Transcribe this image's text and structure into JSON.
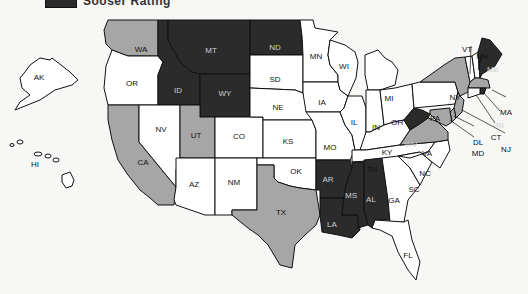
{
  "legend": {
    "label": "Sooser Rating",
    "swatch_color": "#2b2b2b"
  },
  "colors": {
    "dark": "#2b2b2b",
    "gray": "#a6a6a6",
    "white": "#ffffff",
    "background": "#f7f7f5"
  },
  "states": {
    "AK": {
      "label": "AK",
      "fill": "white"
    },
    "HI": {
      "label": "HI",
      "fill": "white"
    },
    "WA": {
      "label": "WA",
      "fill": "gray"
    },
    "OR": {
      "label": "OR",
      "fill": "white"
    },
    "CA": {
      "label": "CA",
      "fill": "gray"
    },
    "ID": {
      "label": "ID",
      "fill": "dark"
    },
    "NV": {
      "label": "NV",
      "fill": "white"
    },
    "MT": {
      "label": "MT",
      "fill": "dark"
    },
    "WY": {
      "label": "WY",
      "fill": "dark"
    },
    "UT": {
      "label": "UT",
      "fill": "gray"
    },
    "AZ": {
      "label": "AZ",
      "fill": "white"
    },
    "CO": {
      "label": "CO",
      "fill": "white"
    },
    "NM": {
      "label": "NM",
      "fill": "white"
    },
    "ND": {
      "label": "ND",
      "fill": "dark"
    },
    "SD": {
      "label": "SD",
      "fill": "white"
    },
    "NE": {
      "label": "NE",
      "fill": "white"
    },
    "KS": {
      "label": "KS",
      "fill": "white"
    },
    "OK": {
      "label": "OK",
      "fill": "white"
    },
    "TX": {
      "label": "TX",
      "fill": "gray"
    },
    "MN": {
      "label": "MN",
      "fill": "white"
    },
    "IA": {
      "label": "IA",
      "fill": "white"
    },
    "MO": {
      "label": "MO",
      "fill": "white"
    },
    "AR": {
      "label": "AR",
      "fill": "dark"
    },
    "LA": {
      "label": "LA",
      "fill": "dark"
    },
    "WI": {
      "label": "WI",
      "fill": "white"
    },
    "IL": {
      "label": "IL",
      "fill": "white"
    },
    "MI": {
      "label": "MI",
      "fill": "white"
    },
    "IN": {
      "label": "IN",
      "fill": "white"
    },
    "OH": {
      "label": "OH",
      "fill": "white"
    },
    "KY": {
      "label": "KY",
      "fill": "white"
    },
    "TN": {
      "label": "TN",
      "fill": "white"
    },
    "MS": {
      "label": "MS",
      "fill": "dark"
    },
    "AL": {
      "label": "AL",
      "fill": "dark"
    },
    "GA": {
      "label": "GA",
      "fill": "white"
    },
    "FL": {
      "label": "FL",
      "fill": "white"
    },
    "SC": {
      "label": "SC",
      "fill": "white"
    },
    "NC": {
      "label": "NC",
      "fill": "white"
    },
    "VA": {
      "label": "VA",
      "fill": "gray"
    },
    "WV": {
      "label": "WV",
      "fill": "dark"
    },
    "PA": {
      "label": "PA",
      "fill": "white"
    },
    "NY": {
      "label": "NY",
      "fill": "gray"
    },
    "VT": {
      "label": "VT",
      "fill": "white"
    },
    "NH": {
      "label": "NH",
      "fill": "white"
    },
    "ME": {
      "label": "ME",
      "fill": "dark"
    },
    "MA": {
      "label": "MA",
      "fill": "gray"
    },
    "RI": {
      "label": "RI",
      "fill": "dark"
    },
    "CT": {
      "label": "CT",
      "fill": "white"
    },
    "NJ": {
      "label": "NJ",
      "fill": "gray"
    },
    "DL": {
      "label": "DL",
      "fill": "gray"
    },
    "MD": {
      "label": "MD",
      "fill": "gray"
    }
  }
}
